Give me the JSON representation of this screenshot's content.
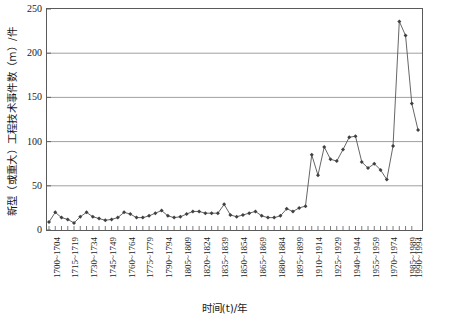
{
  "chart_data": {
    "type": "line",
    "title": "",
    "xlabel": "时间(t)/年",
    "ylabel": "新型（或重大）工程技术事件数（m）/件",
    "ylim": [
      0,
      250
    ],
    "y_ticks": [
      0,
      50,
      100,
      150,
      200,
      250
    ],
    "grid": "horizontal",
    "legend": "none",
    "marker": "diamond",
    "marker_color": "#404040",
    "line_color": "#555555",
    "axis_color": "#5a5a5a",
    "gridline_color": "#888888",
    "x_tick_label_step": 3,
    "categories": [
      "1700~1704",
      "1705~1709",
      "1710~1714",
      "1715~1719",
      "1720~1724",
      "1725~1729",
      "1730~1734",
      "1735~1739",
      "1740~1744",
      "1745~1749",
      "1750~1754",
      "1755~1759",
      "1760~1764",
      "1765~1769",
      "1770~1774",
      "1775~1779",
      "1780~1784",
      "1785~1789",
      "1790~1794",
      "1795~1799",
      "1800~1804",
      "1805~1809",
      "1810~1814",
      "1815~1819",
      "1820~1824",
      "1825~1829",
      "1830~1834",
      "1835~1839",
      "1840~1844",
      "1845~1849",
      "1850~1854",
      "1855~1859",
      "1860~1864",
      "1865~1869",
      "1870~1874",
      "1875~1879",
      "1880~1884",
      "1885~1889",
      "1890~1894",
      "1895~1899",
      "1900~1904",
      "1905~1909",
      "1910~1914",
      "1915~1919",
      "1920~1924",
      "1925~1929",
      "1930~1934",
      "1935~1939",
      "1940~1944",
      "1945~1949",
      "1950~1954",
      "1955~1959",
      "1960~1964",
      "1965~1969",
      "1970~1974",
      "1975~1979",
      "1980~1984",
      "1985~1989",
      "1990~1994"
    ],
    "labeled_categories": [
      "1700~1704",
      "1715~1719",
      "1730~1734",
      "1745~1749",
      "1760~1764",
      "1775~1779",
      "1790~1794",
      "1805~1809",
      "1820~1824",
      "1835~1839",
      "1850~1854",
      "1865~1869",
      "1880~1884",
      "1895~1899",
      "1910~1914",
      "1925~1929",
      "1940~1944",
      "1955~1959",
      "1970~1974",
      "1985~1989",
      "1990~1994"
    ],
    "values": [
      9,
      20,
      14,
      12,
      8,
      15,
      20,
      15,
      13,
      11,
      12,
      14,
      20,
      18,
      14,
      14,
      16,
      19,
      22,
      16,
      14,
      15,
      18,
      21,
      21,
      19,
      19,
      19,
      29,
      17,
      15,
      17,
      19,
      21,
      16,
      14,
      14,
      16,
      24,
      21,
      25,
      27,
      85,
      62,
      94,
      80,
      78,
      91,
      105,
      106,
      77,
      70,
      75,
      68,
      57,
      95,
      236,
      220,
      143
    ],
    "values_tail_extra": 113,
    "peak": {
      "category": "1985~1989",
      "value": 236
    }
  }
}
